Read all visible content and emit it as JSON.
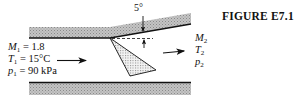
{
  "figure": {
    "caption": "FIGURE E7.1",
    "angle_label": "5°"
  },
  "upstream": {
    "mach": {
      "symbol": "M",
      "sub": "1",
      "rest": " = 1.8"
    },
    "temperature": {
      "symbol": "T",
      "sub": "1",
      "rest": " = 15°C"
    },
    "pressure": {
      "symbol": "p",
      "sub": "1",
      "rest": " = 90 kPa"
    }
  },
  "downstream": {
    "mach": {
      "symbol": "M",
      "sub": "2"
    },
    "temperature": {
      "symbol": "T",
      "sub": "2"
    },
    "pressure": {
      "symbol": "p",
      "sub": "2"
    }
  },
  "colors": {
    "wall_fill": "#b8b8b8",
    "line": "#111111",
    "shock_fill": "#d9d9d9"
  }
}
